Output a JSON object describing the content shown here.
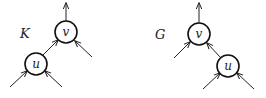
{
  "diagrams": [
    {
      "name": "K",
      "label": "K",
      "nodes": [
        {
          "id": "v",
          "label": "v"
        },
        {
          "id": "u",
          "label": "u"
        }
      ],
      "edges": [
        {
          "from": "v",
          "to": "out-up"
        },
        {
          "from": "u",
          "to": "v"
        },
        {
          "from": "in",
          "to": "v",
          "side": "right"
        },
        {
          "from": "in",
          "to": "u",
          "side": "left"
        },
        {
          "from": "in",
          "to": "u",
          "side": "right"
        }
      ]
    },
    {
      "name": "G",
      "label": "G",
      "nodes": [
        {
          "id": "v",
          "label": "v"
        },
        {
          "id": "u",
          "label": "u"
        }
      ],
      "edges": [
        {
          "from": "v",
          "to": "out-up"
        },
        {
          "from": "u",
          "to": "v"
        },
        {
          "from": "in",
          "to": "v",
          "side": "left"
        },
        {
          "from": "in",
          "to": "u",
          "side": "left"
        },
        {
          "from": "in",
          "to": "u",
          "side": "right"
        }
      ]
    }
  ]
}
